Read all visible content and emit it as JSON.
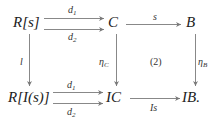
{
  "diagram": {
    "type": "commutative-diagram",
    "nodes": {
      "Rs": {
        "label": "R[s]"
      },
      "C": {
        "label": "C"
      },
      "B": {
        "label": "B"
      },
      "RIs": {
        "label": "R[I(s)]"
      },
      "IC": {
        "label": "IC"
      },
      "IB": {
        "label": "IB."
      }
    },
    "edges": {
      "top_d1": {
        "from": "R[s]",
        "to": "C",
        "label": "d",
        "sub": "1"
      },
      "top_d2": {
        "from": "R[s]",
        "to": "C",
        "label": "d",
        "sub": "2"
      },
      "top_s": {
        "from": "C",
        "to": "B",
        "label": "s"
      },
      "left_l": {
        "from": "R[s]",
        "to": "R[I(s)]",
        "label": "l"
      },
      "mid_etaC": {
        "from": "C",
        "to": "IC",
        "label": "η",
        "sub": "C"
      },
      "right_etaB": {
        "from": "B",
        "to": "IB",
        "label": "η",
        "sub": "B"
      },
      "bot_d1": {
        "from": "R[I(s)]",
        "to": "IC",
        "label": "d",
        "sub": "1"
      },
      "bot_d2": {
        "from": "R[I(s)]",
        "to": "IC",
        "label": "d",
        "sub": "2"
      },
      "bot_Is": {
        "from": "IC",
        "to": "IB",
        "label": "Is"
      }
    },
    "annotation": "(2)",
    "colors": {
      "arrow": "#888888",
      "text": "#222222"
    }
  }
}
